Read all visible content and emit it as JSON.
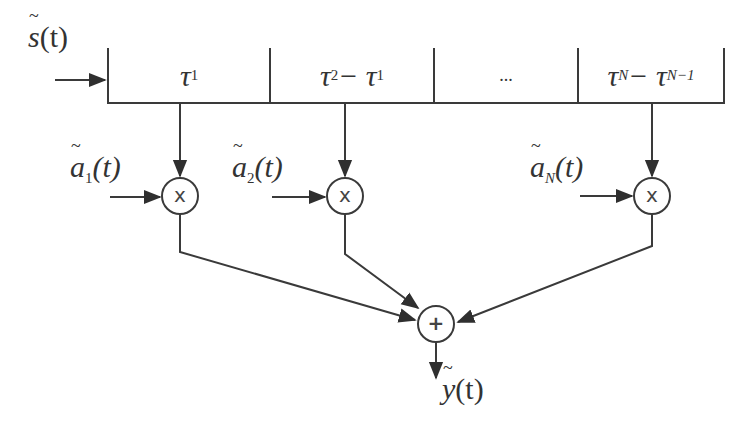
{
  "diagram": {
    "type": "tapped-delay-line channel model",
    "input": {
      "label_base": "s",
      "label_arg": "(t)",
      "tilde": true
    },
    "delay_line": {
      "cells": [
        {
          "id": "cell-1",
          "main": "τ",
          "sub": "1",
          "rest": ""
        },
        {
          "id": "cell-2",
          "main": "τ",
          "sub": "2",
          "rest_main": " − τ",
          "rest_sub": "1"
        },
        {
          "id": "cell-3",
          "text": "..."
        },
        {
          "id": "cell-N",
          "main": "τ",
          "sub": "N",
          "rest_main": " − τ",
          "rest_sub": "N−1"
        }
      ]
    },
    "taps": [
      {
        "coef_base": "a",
        "coef_sub": "1",
        "coef_arg": "(t)",
        "operator": "x"
      },
      {
        "coef_base": "a",
        "coef_sub": "2",
        "coef_arg": "(t)",
        "operator": "x"
      },
      {
        "coef_base": "a",
        "coef_sub": "N",
        "coef_arg": "(t)",
        "operator": "x"
      }
    ],
    "summer": {
      "operator": "+"
    },
    "output": {
      "label_base": "y",
      "label_arg": "(t)",
      "tilde": true
    },
    "colors": {
      "stroke": "#3a3a3a",
      "background": "#ffffff"
    }
  }
}
